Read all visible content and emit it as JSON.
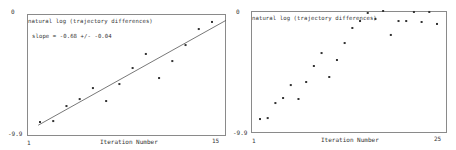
{
  "chart_data": [
    {
      "type": "scatter",
      "title": "natural log (trajectory differences)",
      "annotation": "slope = -0.68 +/- -0.04",
      "xlabel": "Iteration Number",
      "ylabel": "",
      "xlim": [
        1,
        15
      ],
      "ylim": [
        -9.9,
        0
      ],
      "x_tick_labels": [
        "1",
        "15"
      ],
      "y_tick_labels": [
        "0",
        "-9.9"
      ],
      "grid": false,
      "fit_line": {
        "x": [
          2,
          15
        ],
        "y": [
          -9.1,
          -0.6
        ]
      },
      "x": [
        2,
        3,
        4,
        5,
        6,
        7,
        8,
        9,
        10,
        11,
        12,
        13,
        14,
        15
      ],
      "y": [
        -8.84,
        -8.76,
        -7.53,
        -6.96,
        -6.06,
        -7.12,
        -5.73,
        -4.42,
        -3.27,
        -5.24,
        -3.85,
        -2.54,
        -1.23,
        -0.65
      ]
    },
    {
      "type": "scatter",
      "title": "natural log (trajectory differences)",
      "xlabel": "Iteration Number",
      "ylabel": "",
      "xlim": [
        1,
        25
      ],
      "ylim": [
        -9.9,
        0
      ],
      "x_tick_labels": [
        "1",
        "25"
      ],
      "y_tick_labels": [
        "0",
        "-9.9"
      ],
      "grid": false,
      "x": [
        2,
        3,
        4,
        5,
        6,
        7,
        8,
        9,
        10,
        11,
        12,
        13,
        14,
        15,
        16,
        17,
        18,
        19,
        20,
        21,
        22,
        23,
        24,
        25
      ],
      "y": [
        -8.84,
        -8.76,
        -7.53,
        -7.12,
        -6.06,
        -7.2,
        -5.81,
        -4.5,
        -3.44,
        -5.4,
        -4.01,
        -2.62,
        -1.39,
        -0.82,
        -0.16,
        -0.65,
        0.0,
        -1.96,
        -0.82,
        -0.82,
        -0.08,
        -0.9,
        -0.08,
        -1.06
      ]
    }
  ],
  "left": {
    "y_top": "0",
    "y_bottom": "-9.9",
    "x_left": "1",
    "x_right": "15",
    "title": "natural log (trajectory differences)",
    "slope": "slope =  -0.68 +/- -0.04",
    "xlabel": "Iteration Number"
  },
  "right": {
    "y_top": "0",
    "y_bottom": "-9.9",
    "x_left": "1",
    "x_right": "25",
    "title": "natural log (trajectory differences)",
    "xlabel": "Iteration Number"
  },
  "colors": {
    "frame": "#8a8a8a",
    "point": "#333333",
    "line": "#555555"
  }
}
